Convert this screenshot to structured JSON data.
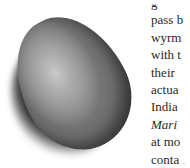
{
  "figure": {
    "colors": {
      "highlight": "#c9c9c9",
      "body": "#6d6d6d",
      "edge": "#3a3a3a",
      "shadow": "#111111"
    }
  },
  "text_column": {
    "lines": [
      {
        "text": "g",
        "style": "normal"
      },
      {
        "text": "pass b",
        "style": "normal"
      },
      {
        "text": "wyrm",
        "style": "normal"
      },
      {
        "text": "with t",
        "style": "normal"
      },
      {
        "text": "their",
        "style": "normal"
      },
      {
        "text": "actua",
        "style": "normal"
      },
      {
        "text": "India",
        "style": "normal"
      },
      {
        "text": "Mari",
        "style": "italic"
      },
      {
        "text": "at mo",
        "style": "normal"
      },
      {
        "text": "conta",
        "style": "normal"
      }
    ]
  }
}
